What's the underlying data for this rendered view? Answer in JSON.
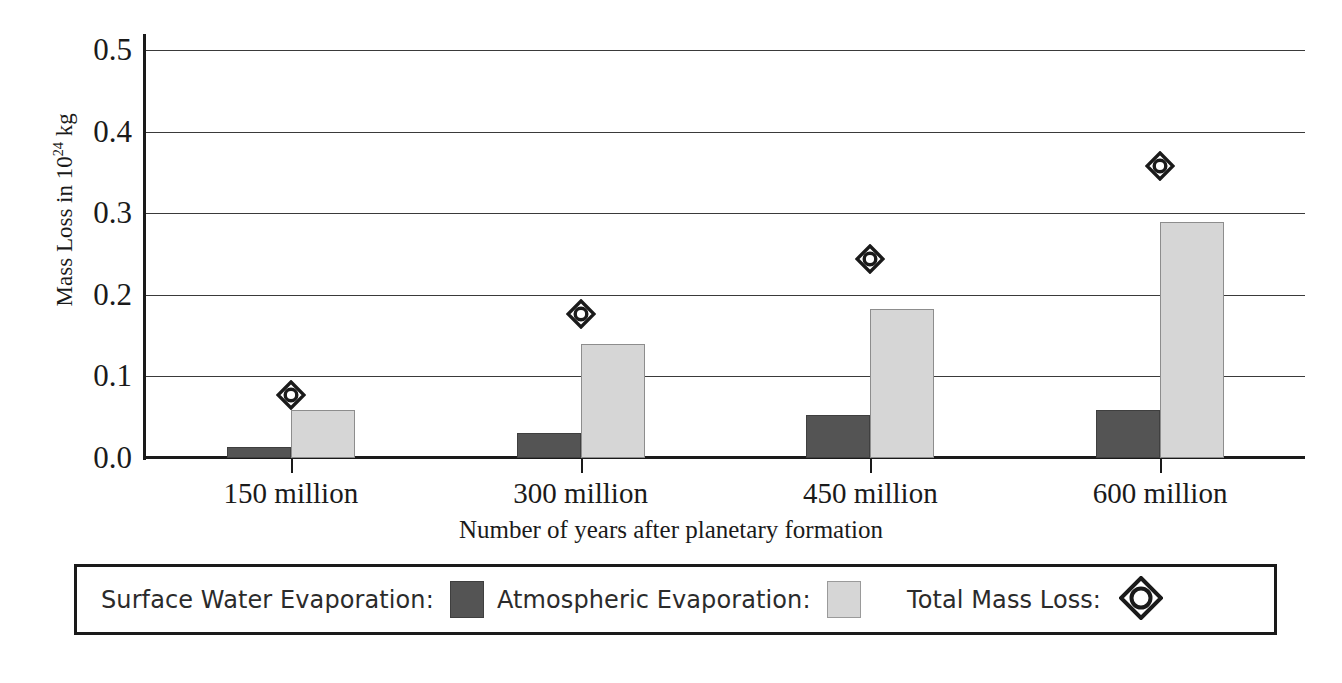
{
  "chart_data": {
    "type": "bar",
    "title": "",
    "xlabel": "Number of years after planetary formation",
    "ylabel": "Mass Loss in 10^24 kg",
    "ylabel_prefix": "Mass Loss in 10",
    "ylabel_superscript": "24",
    "ylabel_suffix": " kg",
    "categories": [
      "150 million",
      "300 million",
      "450 million",
      "600 million"
    ],
    "ylim": [
      0.0,
      0.5
    ],
    "ytick_labels": [
      "0.0",
      "0.1",
      "0.2",
      "0.3",
      "0.4",
      "0.5"
    ],
    "ytick_values": [
      0.0,
      0.1,
      0.2,
      0.3,
      0.4,
      0.5
    ],
    "grid": true,
    "legend_position": "bottom",
    "series": [
      {
        "name": "Surface Water Evaporation",
        "type": "bar",
        "color": "#545454",
        "values": [
          0.013,
          0.031,
          0.053,
          0.059
        ]
      },
      {
        "name": "Atmospheric Evaporation",
        "type": "bar",
        "color": "#d6d6d6",
        "values": [
          0.059,
          0.14,
          0.183,
          0.289
        ]
      },
      {
        "name": "Total Mass Loss",
        "type": "scatter",
        "marker": "diamond",
        "color": "#1a1a1a",
        "values": [
          0.077,
          0.177,
          0.244,
          0.358
        ]
      }
    ]
  },
  "axis": {
    "y_title_prefix": "Mass Loss in 10",
    "y_title_sup": "24",
    "y_title_suffix": " kg",
    "x_title": "Number of years after planetary formation"
  },
  "legend": {
    "items": [
      {
        "label": "Surface Water Evaporation:",
        "swatch": "dark-square-swatch"
      },
      {
        "label": "Atmospheric  Evaporation:",
        "swatch": "light-square-swatch"
      },
      {
        "label": "Total Mass Loss:",
        "swatch": "diamond-marker"
      }
    ]
  }
}
